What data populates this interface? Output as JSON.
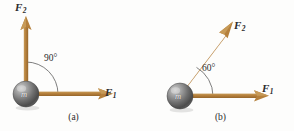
{
  "figure": {
    "background_color": "#fdfdfc",
    "vector_color": "#b5803c",
    "vector_color_dark": "#9a6a2e",
    "arc_color": "#6f6f6f",
    "text_color": "#2b2b2b",
    "mass_color_light": "#b9b9b9",
    "mass_color_dark": "#4a4a4a"
  },
  "panels": [
    {
      "id": "a",
      "caption": "(a)",
      "mass": {
        "label": "m",
        "cx": 26,
        "cy": 94,
        "r": 13
      },
      "angle": {
        "value": "90",
        "degree_symbol": "°",
        "text": "90°"
      },
      "vectors": [
        {
          "name": "F1",
          "label_base": "F",
          "label_sub": "1",
          "direction_deg": 0,
          "origin": {
            "x": 26,
            "y": 94
          },
          "tip": {
            "x": 112,
            "y": 94
          }
        },
        {
          "name": "F2",
          "label_base": "F",
          "label_sub": "2",
          "direction_deg": 90,
          "origin": {
            "x": 26,
            "y": 94
          },
          "tip": {
            "x": 26,
            "y": 17
          }
        }
      ]
    },
    {
      "id": "b",
      "caption": "(b)",
      "mass": {
        "label": "m",
        "cx": 33,
        "cy": 96,
        "r": 13
      },
      "angle": {
        "value": "60",
        "degree_symbol": "°",
        "text": "60°"
      },
      "vectors": [
        {
          "name": "F1",
          "label_base": "F",
          "label_sub": "1",
          "direction_deg": 0,
          "origin": {
            "x": 33,
            "y": 96
          },
          "tip": {
            "x": 121,
            "y": 96
          }
        },
        {
          "name": "F2",
          "label_base": "F",
          "label_sub": "2",
          "direction_deg": 60,
          "origin": {
            "x": 33,
            "y": 96
          },
          "tip": {
            "x": 81,
            "y": 25
          }
        }
      ]
    }
  ]
}
